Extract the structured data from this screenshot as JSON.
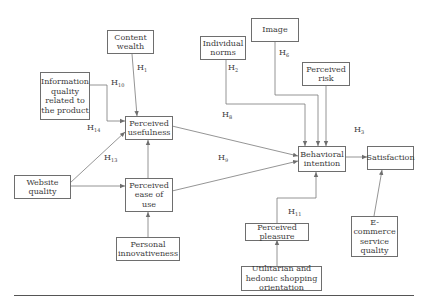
{
  "diagram": {
    "type": "research-model",
    "nodes": {
      "content_wealth": "Content wealth",
      "info_quality": "Information quality related to the product",
      "perceived_usefulness": "Perceived usefulness",
      "website_quality": "Website quality",
      "perceived_ease_of_use": "Perceived ease of use",
      "personal_innovativeness": "Personal innovativeness",
      "individual_norms": "Individual norms",
      "image": "Image",
      "perceived_risk": "Perceived risk",
      "behavioral_intention": "Behavioral intention",
      "satisfaction": "Satisfaction",
      "ecommerce_service_quality": "E-commerce service quality",
      "perceived_pleasure": "Perceived pleasure",
      "utilitarian_hedonic": "Utilitarian and hedonic shopping orientation"
    },
    "hypotheses": {
      "h1": {
        "letter": "H",
        "sub": "1"
      },
      "h10": {
        "letter": "H",
        "sub": "10"
      },
      "h14": {
        "letter": "H",
        "sub": "14"
      },
      "h13": {
        "letter": "H",
        "sub": "13"
      },
      "h2": {
        "letter": "H",
        "sub": "2"
      },
      "h6": {
        "letter": "H",
        "sub": "6"
      },
      "h8": {
        "letter": "H",
        "sub": "8"
      },
      "h9": {
        "letter": "H",
        "sub": "9"
      },
      "h3": {
        "letter": "H",
        "sub": "3"
      },
      "h11": {
        "letter": "H",
        "sub": "11"
      }
    },
    "edges": [
      {
        "from": "Content wealth",
        "to": "Perceived usefulness",
        "label": "H1"
      },
      {
        "from": "Information quality related to the product",
        "to": "Perceived usefulness",
        "label": "H10"
      },
      {
        "from": "Website quality",
        "to": "Perceived usefulness",
        "label": "H13"
      },
      {
        "from": "Website quality",
        "to": "Perceived ease of use",
        "label": ""
      },
      {
        "from": "Perceived ease of use",
        "to": "Perceived usefulness",
        "label": ""
      },
      {
        "from": "Personal innovativeness",
        "to": "Perceived ease of use",
        "label": ""
      },
      {
        "from": "Perceived usefulness",
        "to": "Behavioral intention",
        "label": "H8"
      },
      {
        "from": "Perceived ease of use",
        "to": "Behavioral intention",
        "label": "H9"
      },
      {
        "from": "Individual norms",
        "to": "Behavioral intention",
        "label": "H2"
      },
      {
        "from": "Image",
        "to": "Behavioral intention",
        "label": "H6"
      },
      {
        "from": "Perceived risk",
        "to": "Behavioral intention",
        "label": ""
      },
      {
        "from": "Behavioral intention",
        "to": "Satisfaction",
        "label": "H3"
      },
      {
        "from": "E-commerce service quality",
        "to": "Satisfaction",
        "label": ""
      },
      {
        "from": "Perceived pleasure",
        "to": "Behavioral intention",
        "label": "H11"
      },
      {
        "from": "Utilitarian and hedonic shopping orientation",
        "to": "Perceived pleasure",
        "label": ""
      }
    ],
    "colors": {
      "line": "#6e6e6e",
      "text": "#3c3c3c",
      "background": "#ffffff"
    }
  }
}
